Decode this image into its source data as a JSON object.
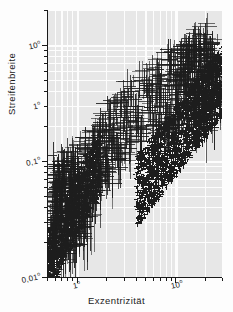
{
  "figure": {
    "background": "#fdfdfd",
    "plot_background": "#e7e7e7",
    "grid_color": "#fdfdfd",
    "ink_color": "#1d1d1d"
  },
  "chart_data": {
    "type": "scatter",
    "title": "",
    "xlabel": "Exzentrizität",
    "ylabel": "Streifenbreite",
    "xscale": "log",
    "yscale": "log",
    "grid": true,
    "legend": "none",
    "marker": "error-bar-cross",
    "xlim": [
      0.5,
      30
    ],
    "ylim": [
      0.01,
      2.0
    ],
    "xticks": [
      {
        "value": 1,
        "label": "1°"
      },
      {
        "value": 10,
        "label": "10°"
      }
    ],
    "yticks": [
      {
        "value": 1.0,
        "label": "10°"
      },
      {
        "value": 0.3,
        "label": "1°"
      },
      {
        "value": 0.1,
        "label": "0,1°"
      },
      {
        "value": 0.01,
        "label": "0,01°"
      }
    ],
    "xtick_labels": [
      "1°",
      "10°"
    ],
    "ytick_labels": [
      "10°",
      "1°",
      "0,1°",
      "0,01°"
    ],
    "points": [
      {
        "x": 0.56,
        "y": 0.017,
        "xerr": 0.1,
        "yerr": 0.006
      },
      {
        "x": 0.58,
        "y": 0.013,
        "xerr": 0.09,
        "yerr": 0.005
      },
      {
        "x": 0.6,
        "y": 0.022,
        "xerr": 0.11,
        "yerr": 0.007
      },
      {
        "x": 0.61,
        "y": 0.03,
        "xerr": 0.1,
        "yerr": 0.009
      },
      {
        "x": 0.62,
        "y": 0.041,
        "xerr": 0.12,
        "yerr": 0.012
      },
      {
        "x": 0.63,
        "y": 0.055,
        "xerr": 0.11,
        "yerr": 0.015
      },
      {
        "x": 0.64,
        "y": 0.072,
        "xerr": 0.13,
        "yerr": 0.019
      },
      {
        "x": 0.65,
        "y": 0.09,
        "xerr": 0.12,
        "yerr": 0.024
      },
      {
        "x": 0.66,
        "y": 0.06,
        "xerr": 0.14,
        "yerr": 0.017
      },
      {
        "x": 0.67,
        "y": 0.045,
        "xerr": 0.12,
        "yerr": 0.013
      },
      {
        "x": 0.68,
        "y": 0.034,
        "xerr": 0.13,
        "yerr": 0.01
      },
      {
        "x": 0.7,
        "y": 0.026,
        "xerr": 0.14,
        "yerr": 0.008
      },
      {
        "x": 0.71,
        "y": 0.019,
        "xerr": 0.12,
        "yerr": 0.006
      },
      {
        "x": 0.72,
        "y": 0.08,
        "xerr": 0.15,
        "yerr": 0.022
      },
      {
        "x": 0.74,
        "y": 0.1,
        "xerr": 0.16,
        "yerr": 0.027
      },
      {
        "x": 0.75,
        "y": 0.065,
        "xerr": 0.14,
        "yerr": 0.018
      },
      {
        "x": 0.77,
        "y": 0.048,
        "xerr": 0.15,
        "yerr": 0.014
      },
      {
        "x": 0.79,
        "y": 0.037,
        "xerr": 0.16,
        "yerr": 0.011
      },
      {
        "x": 0.8,
        "y": 0.028,
        "xerr": 0.14,
        "yerr": 0.009
      },
      {
        "x": 0.82,
        "y": 0.021,
        "xerr": 0.15,
        "yerr": 0.007
      },
      {
        "x": 0.84,
        "y": 0.016,
        "xerr": 0.16,
        "yerr": 0.005
      },
      {
        "x": 0.86,
        "y": 0.07,
        "xerr": 0.17,
        "yerr": 0.02
      },
      {
        "x": 0.88,
        "y": 0.095,
        "xerr": 0.18,
        "yerr": 0.026
      },
      {
        "x": 0.9,
        "y": 0.055,
        "xerr": 0.17,
        "yerr": 0.016
      },
      {
        "x": 0.92,
        "y": 0.042,
        "xerr": 0.18,
        "yerr": 0.012
      },
      {
        "x": 0.95,
        "y": 0.032,
        "xerr": 0.19,
        "yerr": 0.01
      },
      {
        "x": 0.98,
        "y": 0.024,
        "xerr": 0.18,
        "yerr": 0.008
      },
      {
        "x": 1.0,
        "y": 0.11,
        "xerr": 0.22,
        "yerr": 0.03
      },
      {
        "x": 1.03,
        "y": 0.085,
        "xerr": 0.2,
        "yerr": 0.023
      },
      {
        "x": 1.06,
        "y": 0.062,
        "xerr": 0.21,
        "yerr": 0.018
      },
      {
        "x": 1.1,
        "y": 0.046,
        "xerr": 0.22,
        "yerr": 0.014
      },
      {
        "x": 1.14,
        "y": 0.035,
        "xerr": 0.23,
        "yerr": 0.011
      },
      {
        "x": 1.18,
        "y": 0.027,
        "xerr": 0.22,
        "yerr": 0.009
      },
      {
        "x": 1.22,
        "y": 0.13,
        "xerr": 0.26,
        "yerr": 0.035
      },
      {
        "x": 1.27,
        "y": 0.1,
        "xerr": 0.25,
        "yerr": 0.028
      },
      {
        "x": 1.32,
        "y": 0.075,
        "xerr": 0.26,
        "yerr": 0.021
      },
      {
        "x": 1.38,
        "y": 0.056,
        "xerr": 0.28,
        "yerr": 0.017
      },
      {
        "x": 1.44,
        "y": 0.043,
        "xerr": 0.29,
        "yerr": 0.013
      },
      {
        "x": 1.5,
        "y": 0.16,
        "xerr": 0.32,
        "yerr": 0.042
      },
      {
        "x": 1.57,
        "y": 0.12,
        "xerr": 0.31,
        "yerr": 0.033
      },
      {
        "x": 1.64,
        "y": 0.09,
        "xerr": 0.33,
        "yerr": 0.026
      },
      {
        "x": 1.72,
        "y": 0.068,
        "xerr": 0.34,
        "yerr": 0.02
      },
      {
        "x": 1.8,
        "y": 0.2,
        "xerr": 0.38,
        "yerr": 0.052
      },
      {
        "x": 1.9,
        "y": 0.15,
        "xerr": 0.38,
        "yerr": 0.04
      },
      {
        "x": 2.0,
        "y": 0.11,
        "xerr": 0.4,
        "yerr": 0.031
      },
      {
        "x": 2.1,
        "y": 0.082,
        "xerr": 0.42,
        "yerr": 0.024
      },
      {
        "x": 2.2,
        "y": 0.26,
        "xerr": 0.46,
        "yerr": 0.068
      },
      {
        "x": 2.35,
        "y": 0.19,
        "xerr": 0.47,
        "yerr": 0.05
      },
      {
        "x": 2.5,
        "y": 0.14,
        "xerr": 0.5,
        "yerr": 0.038
      },
      {
        "x": 2.65,
        "y": 0.105,
        "xerr": 0.53,
        "yerr": 0.03
      },
      {
        "x": 2.8,
        "y": 0.32,
        "xerr": 0.58,
        "yerr": 0.082
      },
      {
        "x": 3.0,
        "y": 0.24,
        "xerr": 0.6,
        "yerr": 0.062
      },
      {
        "x": 3.2,
        "y": 0.175,
        "xerr": 0.64,
        "yerr": 0.046
      },
      {
        "x": 3.4,
        "y": 0.13,
        "xerr": 0.68,
        "yerr": 0.036
      },
      {
        "x": 3.6,
        "y": 0.4,
        "xerr": 0.74,
        "yerr": 0.1
      },
      {
        "x": 3.9,
        "y": 0.3,
        "xerr": 0.78,
        "yerr": 0.078
      },
      {
        "x": 4.2,
        "y": 0.22,
        "xerr": 0.84,
        "yerr": 0.058
      },
      {
        "x": 4.5,
        "y": 0.165,
        "xerr": 0.9,
        "yerr": 0.045
      },
      {
        "x": 4.8,
        "y": 0.5,
        "xerr": 0.98,
        "yerr": 0.125
      },
      {
        "x": 5.2,
        "y": 0.37,
        "xerr": 1.04,
        "yerr": 0.096
      },
      {
        "x": 5.6,
        "y": 0.275,
        "xerr": 1.12,
        "yerr": 0.072
      },
      {
        "x": 6.0,
        "y": 0.205,
        "xerr": 1.2,
        "yerr": 0.055
      },
      {
        "x": 6.5,
        "y": 0.62,
        "xerr": 1.3,
        "yerr": 0.155
      },
      {
        "x": 7.0,
        "y": 0.46,
        "xerr": 1.4,
        "yerr": 0.118
      },
      {
        "x": 7.5,
        "y": 0.34,
        "xerr": 1.5,
        "yerr": 0.089
      },
      {
        "x": 8.0,
        "y": 0.255,
        "xerr": 1.6,
        "yerr": 0.068
      },
      {
        "x": 8.5,
        "y": 0.19,
        "xerr": 1.7,
        "yerr": 0.052
      },
      {
        "x": 9.0,
        "y": 0.75,
        "xerr": 1.8,
        "yerr": 0.185
      },
      {
        "x": 9.5,
        "y": 0.56,
        "xerr": 1.9,
        "yerr": 0.142
      },
      {
        "x": 10.0,
        "y": 0.42,
        "xerr": 2.0,
        "yerr": 0.108
      },
      {
        "x": 10.5,
        "y": 0.31,
        "xerr": 2.1,
        "yerr": 0.082
      },
      {
        "x": 11.0,
        "y": 0.235,
        "xerr": 2.2,
        "yerr": 0.063
      },
      {
        "x": 11.5,
        "y": 0.9,
        "xerr": 2.3,
        "yerr": 0.22
      },
      {
        "x": 12.0,
        "y": 0.68,
        "xerr": 2.4,
        "yerr": 0.172
      },
      {
        "x": 12.5,
        "y": 0.51,
        "xerr": 2.5,
        "yerr": 0.13
      },
      {
        "x": 13.0,
        "y": 0.38,
        "xerr": 2.6,
        "yerr": 0.099
      },
      {
        "x": 13.5,
        "y": 0.285,
        "xerr": 2.7,
        "yerr": 0.076
      },
      {
        "x": 14.0,
        "y": 1.0,
        "xerr": 2.8,
        "yerr": 0.25
      },
      {
        "x": 14.5,
        "y": 0.79,
        "xerr": 2.9,
        "yerr": 0.2
      },
      {
        "x": 15.0,
        "y": 0.59,
        "xerr": 3.0,
        "yerr": 0.152
      },
      {
        "x": 15.5,
        "y": 0.44,
        "xerr": 3.1,
        "yerr": 0.115
      },
      {
        "x": 16.0,
        "y": 0.33,
        "xerr": 3.2,
        "yerr": 0.088
      },
      {
        "x": 16.5,
        "y": 0.25,
        "xerr": 3.3,
        "yerr": 0.068
      },
      {
        "x": 17.0,
        "y": 1.15,
        "xerr": 3.4,
        "yerr": 0.29
      },
      {
        "x": 17.5,
        "y": 0.88,
        "xerr": 3.5,
        "yerr": 0.225
      },
      {
        "x": 18.0,
        "y": 0.66,
        "xerr": 3.6,
        "yerr": 0.17
      },
      {
        "x": 18.5,
        "y": 0.495,
        "xerr": 3.7,
        "yerr": 0.13
      },
      {
        "x": 19.0,
        "y": 0.37,
        "xerr": 3.8,
        "yerr": 0.098
      },
      {
        "x": 19.5,
        "y": 0.28,
        "xerr": 3.9,
        "yerr": 0.076
      },
      {
        "x": 20.0,
        "y": 1.25,
        "xerr": 4.0,
        "yerr": 0.31
      },
      {
        "x": 20.5,
        "y": 0.95,
        "xerr": 4.1,
        "yerr": 0.242
      },
      {
        "x": 21.0,
        "y": 0.72,
        "xerr": 4.2,
        "yerr": 0.185
      },
      {
        "x": 21.5,
        "y": 0.545,
        "xerr": 4.3,
        "yerr": 0.142
      },
      {
        "x": 22.0,
        "y": 0.41,
        "xerr": 4.4,
        "yerr": 0.108
      },
      {
        "x": 22.5,
        "y": 0.31,
        "xerr": 4.5,
        "yerr": 0.084
      },
      {
        "x": 23.0,
        "y": 0.235,
        "xerr": 4.6,
        "yerr": 0.064
      },
      {
        "x": 24.0,
        "y": 1.05,
        "xerr": 4.8,
        "yerr": 0.265
      },
      {
        "x": 25.0,
        "y": 0.8,
        "xerr": 5.0,
        "yerr": 0.205
      },
      {
        "x": 26.0,
        "y": 0.61,
        "xerr": 5.2,
        "yerr": 0.158
      },
      {
        "x": 27.0,
        "y": 0.465,
        "xerr": 5.4,
        "yerr": 0.122
      },
      {
        "x": 28.0,
        "y": 0.355,
        "xerr": 5.6,
        "yerr": 0.094
      }
    ]
  }
}
